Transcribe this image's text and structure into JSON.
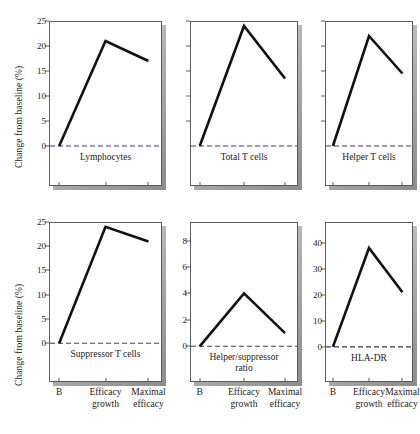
{
  "figure": {
    "y_axis_title_top": "Change from baseline (%)",
    "y_axis_title_bottom": "Change from baseline (%)",
    "line_color": "#111111",
    "zero_line_color": "#3a3a6a",
    "frame_color": "#5a5a5a"
  },
  "x_labels": {
    "baseline": "B",
    "efficacy_growth": "Efficacy\ngrowth",
    "maximal_efficacy": "Maximal\nefficacy"
  },
  "chart_data": [
    {
      "type": "line",
      "title": "Lymphocytes",
      "xlabel": "",
      "ylabel": "Change from baseline (%)",
      "categories": [
        "B",
        "Efficacy growth",
        "Maximal efficacy"
      ],
      "values": [
        0,
        21,
        17
      ],
      "yticks": [
        0,
        5,
        10,
        15,
        20,
        25
      ],
      "ytick_labels": [
        "0",
        "5",
        "10",
        "15",
        "20",
        "25"
      ],
      "ylim": [
        -8,
        25
      ],
      "zero_line": 0,
      "grid": false,
      "legend": "none"
    },
    {
      "type": "line",
      "title": "Total T cells",
      "xlabel": "",
      "ylabel": "",
      "categories": [
        "B",
        "Efficacy growth",
        "Maximal efficacy"
      ],
      "values": [
        0,
        24,
        13.5
      ],
      "yticks": [
        5,
        10,
        15,
        20,
        25
      ],
      "ytick_labels": [
        "",
        "",
        "",
        "",
        ""
      ],
      "ylim": [
        -8,
        25
      ],
      "zero_line": 0,
      "grid": false,
      "legend": "none"
    },
    {
      "type": "line",
      "title": "Helper T cells",
      "xlabel": "",
      "ylabel": "",
      "categories": [
        "B",
        "Efficacy growth",
        "Maximal efficacy"
      ],
      "values": [
        0,
        22,
        14.5
      ],
      "yticks": [
        5,
        10,
        15,
        20,
        25
      ],
      "ytick_labels": [
        "",
        "",
        "",
        "",
        ""
      ],
      "ylim": [
        -8,
        25
      ],
      "zero_line": 0,
      "grid": false,
      "legend": "none"
    },
    {
      "type": "line",
      "title": "Suppressor T cells",
      "xlabel": "",
      "ylabel": "Change from baseline (%)",
      "categories": [
        "B",
        "Efficacy growth",
        "Maximal efficacy"
      ],
      "values": [
        0,
        24,
        21
      ],
      "yticks": [
        0,
        5,
        10,
        15,
        20,
        25
      ],
      "ytick_labels": [
        "0",
        "5",
        "10",
        "15",
        "20",
        "25"
      ],
      "ylim": [
        -8,
        25
      ],
      "zero_line": 0,
      "grid": false,
      "legend": "none"
    },
    {
      "type": "line",
      "title": "Helper/suppressor\nratio",
      "xlabel": "",
      "ylabel": "",
      "categories": [
        "B",
        "Efficacy growth",
        "Maximal efficacy"
      ],
      "values": [
        0,
        4,
        1
      ],
      "yticks": [
        0,
        2,
        4,
        6,
        8
      ],
      "ytick_labels": [
        "0",
        "2",
        "4",
        "6",
        "8"
      ],
      "ylim": [
        -2.7,
        9.4
      ],
      "zero_line": 0,
      "grid": false,
      "legend": "none"
    },
    {
      "type": "line",
      "title": "HLA-DR",
      "xlabel": "",
      "ylabel": "",
      "categories": [
        "B",
        "Efficacy growth",
        "Maximal efficacy"
      ],
      "values": [
        0,
        38,
        21
      ],
      "yticks": [
        0,
        10,
        20,
        30,
        40
      ],
      "ytick_labels": [
        "0",
        "10",
        "20",
        "30",
        "40"
      ],
      "ylim": [
        -13.5,
        48
      ],
      "zero_line": 0,
      "grid": false,
      "legend": "none"
    }
  ]
}
